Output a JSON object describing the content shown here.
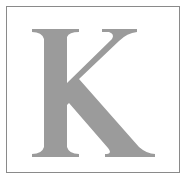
{
  "tile": {
    "letter": "K",
    "letter_color": "#9b9b9b",
    "border_color": "#8a8a8a",
    "background_color": "#ffffff"
  }
}
